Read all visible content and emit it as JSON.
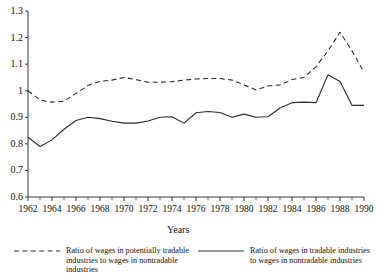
{
  "chart_data": {
    "type": "line",
    "title": "",
    "xlabel": "Years",
    "ylabel": "",
    "xlim": [
      1962,
      1990
    ],
    "ylim": [
      0.6,
      1.3
    ],
    "grid": false,
    "legend_position": "bottom",
    "x": [
      1962,
      1963,
      1964,
      1965,
      1966,
      1967,
      1968,
      1969,
      1970,
      1971,
      1972,
      1973,
      1974,
      1975,
      1976,
      1977,
      1978,
      1979,
      1980,
      1981,
      1982,
      1983,
      1984,
      1985,
      1986,
      1987,
      1988,
      1989,
      1990
    ],
    "xticks": [
      "1962",
      "1964",
      "1966",
      "1968",
      "1970",
      "1972",
      "1974",
      "1976",
      "1978",
      "1980",
      "1982",
      "1984",
      "1986",
      "1988",
      "1990"
    ],
    "yticks": [
      "0.6",
      "0.7",
      "0.8",
      "0.9",
      "1",
      "1.1",
      "1.2",
      "1.3"
    ],
    "series": [
      {
        "name": "Ratio of wages in potentially tradable industries to wages in nontradable industries",
        "style": "dashed",
        "color": "#2b2b2b",
        "values": [
          1.0,
          0.965,
          0.957,
          0.96,
          0.99,
          1.02,
          1.035,
          1.04,
          1.05,
          1.042,
          1.032,
          1.032,
          1.034,
          1.04,
          1.044,
          1.046,
          1.046,
          1.04,
          1.022,
          1.003,
          1.018,
          1.022,
          1.042,
          1.05,
          1.09,
          1.15,
          1.22,
          1.15,
          1.07
        ]
      },
      {
        "name": "Ratio of wages in tradable industries to wages in nontradable industries",
        "style": "solid",
        "color": "#2b2b2b",
        "values": [
          0.825,
          0.79,
          0.815,
          0.855,
          0.888,
          0.9,
          0.895,
          0.885,
          0.878,
          0.878,
          0.886,
          0.9,
          0.902,
          0.878,
          0.917,
          0.922,
          0.918,
          0.9,
          0.912,
          0.9,
          0.902,
          0.935,
          0.955,
          0.957,
          0.955,
          1.06,
          1.035,
          0.945,
          0.945
        ]
      }
    ]
  },
  "axis": {
    "y_title": "",
    "x_title": "Years"
  },
  "legend": {
    "entries": [
      {
        "style": "dashed",
        "label": "Ratio of wages in potentially tradable\nindustries to wages in nontradable\nindustries"
      },
      {
        "style": "solid",
        "label": "Ratio of wages in tradable industries\nto wages in nontradable industries"
      }
    ]
  }
}
